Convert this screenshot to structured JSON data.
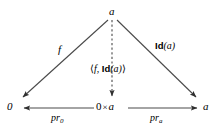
{
  "diagram": {
    "type": "commutative-diagram",
    "background_color": "#ffffff",
    "line_color": "#3a3a3a",
    "text_color": "#000000",
    "nodes": [
      {
        "id": "apex",
        "label": "a",
        "x": 112,
        "y": 12
      },
      {
        "id": "bottom-left",
        "label": "0",
        "x": 11,
        "y": 107
      },
      {
        "id": "bottom-center",
        "label_left": "0",
        "label_op": "×",
        "label_right": "a",
        "x": 110,
        "y": 107
      },
      {
        "id": "bottom-right",
        "label": "a",
        "x": 206,
        "y": 107
      }
    ],
    "edges": [
      {
        "id": "f-edge",
        "from": "apex",
        "to": "bottom-left",
        "style": "solid",
        "label": "f",
        "label_x": 58,
        "label_y": 46
      },
      {
        "id": "pair-edge",
        "from": "apex",
        "to": "bottom-center",
        "style": "dashed",
        "label_open": "⟨",
        "label_f": "f",
        "label_comma": ",",
        "label_id": "Id",
        "label_arg": "(a)",
        "label_close": "⟩",
        "label_x": 106,
        "label_y": 66
      },
      {
        "id": "id-edge",
        "from": "apex",
        "to": "bottom-right",
        "style": "solid",
        "label_id": "Id",
        "label_arg": "(a)",
        "label_x": 155,
        "label_y": 43
      },
      {
        "id": "pr0-edge",
        "from": "bottom-center",
        "to": "bottom-left",
        "style": "solid",
        "label_pr": "pr",
        "label_sub": "0",
        "label_x": 51,
        "label_y": 115
      },
      {
        "id": "pra-edge",
        "from": "bottom-center",
        "to": "bottom-right",
        "style": "solid",
        "label_pr": "pr",
        "label_sub": "a",
        "label_x": 150,
        "label_y": 115
      }
    ]
  }
}
